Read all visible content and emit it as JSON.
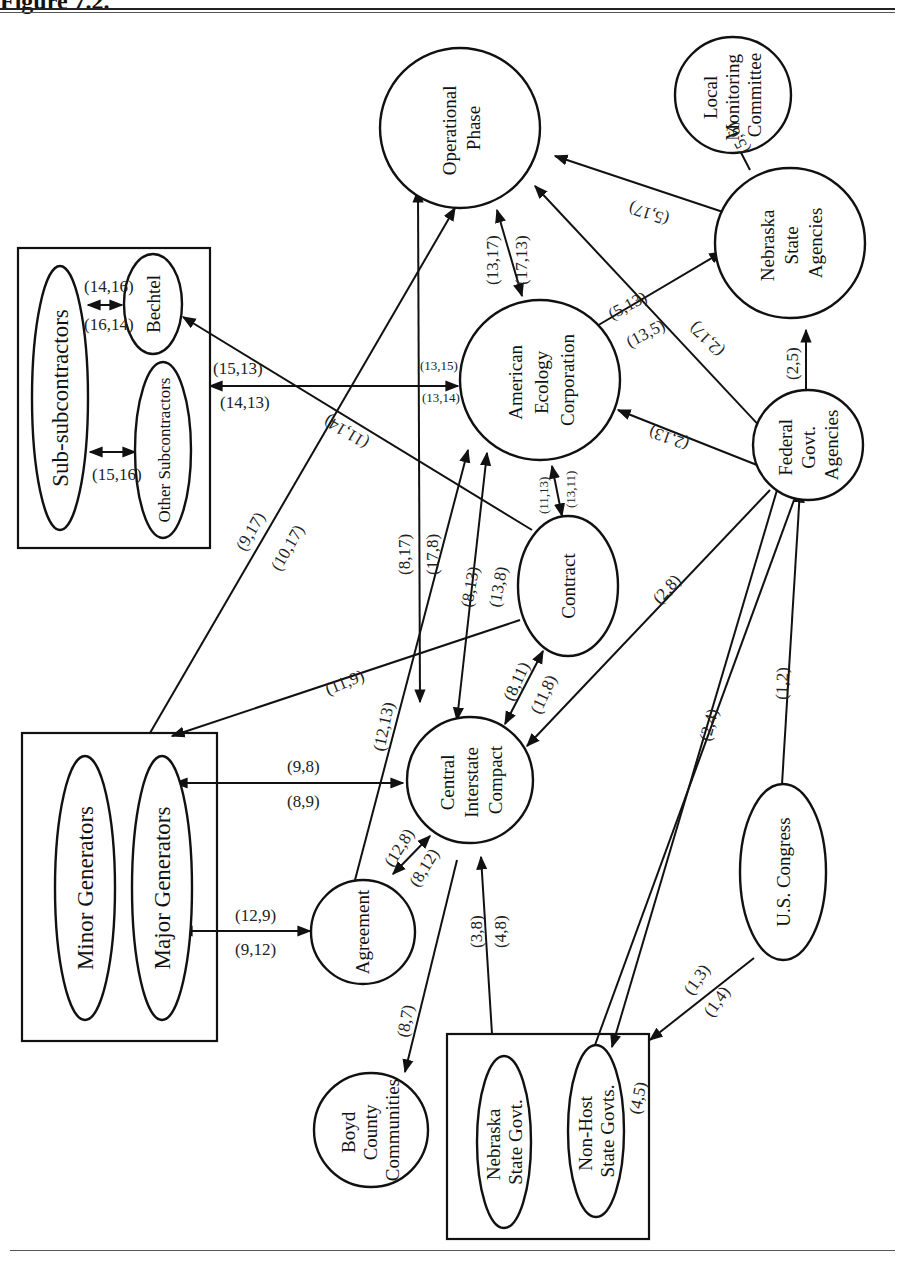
{
  "figure": {
    "title": "Figure 7.2.",
    "orientation": "rotated 90° (text reads bottom-to-top)"
  },
  "groups": {
    "subcontractors_box": [
      "Sub-subcontractors",
      "Bechtel",
      "Other Subcontractors"
    ],
    "generators_box": [
      "Minor Generators",
      "Major Generators"
    ],
    "states_box": [
      "Nebraska State Govt.",
      "Non-Host State Govts."
    ]
  },
  "nodes": {
    "operational_phase": [
      "Operational",
      "Phase"
    ],
    "local_monitoring": [
      "Local",
      "Monitoring",
      "Committee"
    ],
    "nebraska_agencies": [
      "Nebraska",
      "State",
      "Agencies"
    ],
    "american_ecology": [
      "American",
      "Ecology",
      "Corporation"
    ],
    "federal_agencies": [
      "Federal",
      "Govt.",
      "Agencies"
    ],
    "contract": "Contract",
    "central_compact": [
      "Central",
      "Interstate",
      "Compact"
    ],
    "agreement": "Agreement",
    "us_congress": "U.S. Congress",
    "boyd_county": [
      "Boyd",
      "County",
      "Communities"
    ],
    "sub_subcontractors": "Sub-subcontractors",
    "bechtel": "Bechtel",
    "other_subcontractors": "Other Subcontractors",
    "minor_generators": "Minor Generators",
    "major_generators": "Major Generators",
    "nebraska_state_govt": [
      "Nebraska",
      "State Govt."
    ],
    "non_host_states": [
      "Non-Host",
      "State Govts."
    ]
  },
  "edges": [
    {
      "from": "Sub-subcontractors",
      "to": "Bechtel",
      "labels": [
        "(14,16)",
        "(16,14)"
      ]
    },
    {
      "from": "Sub-subcontractors",
      "to": "Other Subcontractors",
      "labels": [
        "(15,16)"
      ]
    },
    {
      "from": "American Ecology Corporation",
      "to": "Subcontractors box",
      "labels": [
        "(15,13)",
        "(14,13)",
        "(13,15)",
        "(13,14)"
      ]
    },
    {
      "from": "Contract",
      "to": "Bechtel",
      "labels": [
        "(11,14)"
      ]
    },
    {
      "from": "Generators box",
      "to": "Operational Phase",
      "labels": [
        "(9,17)",
        "(10,17)"
      ]
    },
    {
      "from": "Central Interstate Compact",
      "to": "Operational Phase",
      "labels": [
        "(8,17)",
        "(17,8)"
      ]
    },
    {
      "from": "American Ecology Corporation",
      "to": "Operational Phase",
      "labels": [
        "(13,17)",
        "(17,13)"
      ]
    },
    {
      "from": "Nebraska State Agencies",
      "to": "Operational Phase",
      "labels": [
        "(5,17)"
      ]
    },
    {
      "from": "Federal Govt. Agencies",
      "to": "Operational Phase",
      "labels": [
        "(2,17)"
      ]
    },
    {
      "from": "Nebraska State Agencies",
      "to": "Local Monitoring Committee",
      "labels": [
        "(5,6)"
      ]
    },
    {
      "from": "American Ecology Corporation",
      "to": "Nebraska State Agencies",
      "labels": [
        "(5,13)",
        "(13,5)"
      ]
    },
    {
      "from": "Federal Govt. Agencies",
      "to": "Nebraska State Agencies",
      "labels": [
        "(2,5)"
      ]
    },
    {
      "from": "Federal Govt. Agencies",
      "to": "American Ecology Corporation",
      "labels": [
        "(2,13)"
      ]
    },
    {
      "from": "American Ecology Corporation",
      "to": "Contract",
      "labels": [
        "(11,13)",
        "(13,11)"
      ]
    },
    {
      "from": "Central Interstate Compact",
      "to": "American Ecology Corporation",
      "labels": [
        "(8,13)",
        "(13,8)"
      ]
    },
    {
      "from": "Agreement",
      "to": "American Ecology Corporation",
      "labels": [
        "(12,13)"
      ]
    },
    {
      "from": "Contract",
      "to": "Major Generators",
      "labels": [
        "(11,9)"
      ]
    },
    {
      "from": "Federal Govt. Agencies",
      "to": "Central Interstate Compact",
      "labels": [
        "(2,8)"
      ]
    },
    {
      "from": "Central Interstate Compact",
      "to": "Contract",
      "labels": [
        "(8,11)",
        "(11,8)"
      ]
    },
    {
      "from": "Major Generators",
      "to": "Central Interstate Compact",
      "labels": [
        "(9,8)",
        "(8,9)"
      ]
    },
    {
      "from": "Agreement",
      "to": "Central Interstate Compact",
      "labels": [
        "(12,8)",
        "(8,12)"
      ]
    },
    {
      "from": "Major Generators",
      "to": "Agreement",
      "labels": [
        "(12,9)",
        "(9,12)"
      ]
    },
    {
      "from": "Central Interstate Compact",
      "to": "Boyd County Communities",
      "labels": [
        "(8,7)"
      ]
    },
    {
      "from": "States box",
      "to": "Central Interstate Compact",
      "labels": [
        "(3,8)",
        "(4,8)"
      ]
    },
    {
      "from": "Non-Host State Govts.",
      "to": "Nebraska State Agencies",
      "labels": [
        "(4,5)"
      ]
    },
    {
      "from": "Federal Govt. Agencies",
      "to": "Non-Host State Govts.",
      "labels": [
        "(2,4)"
      ]
    },
    {
      "from": "U.S. Congress",
      "to": "Federal Govt. Agencies",
      "labels": [
        "(1,2)"
      ]
    },
    {
      "from": "U.S. Congress",
      "to": "States box",
      "labels": [
        "(1,3)",
        "(1,4)"
      ]
    }
  ],
  "edge_labels": {
    "l14_16": "(14,16)",
    "l16_14": "(16,14)",
    "l15_16": "(15,16)",
    "l15_13": "(15,13)",
    "l14_13": "(14,13)",
    "l13_15": "(13,15)",
    "l13_14": "(13,14)",
    "l11_14": "(11,14)",
    "l9_17": "(9,17)",
    "l10_17": "(10,17)",
    "l8_17": "(8,17)",
    "l17_8": "(17,8)",
    "l13_17": "(13,17)",
    "l17_13": "(17,13)",
    "l5_17": "(5,17)",
    "l2_17": "(2,17)",
    "l5_6": "(5,6)",
    "l5_13": "(5,13)",
    "l13_5": "(13,5)",
    "l2_5": "(2,5)",
    "l2_13": "(2,13)",
    "l11_13": "(11,13)",
    "l13_11": "(13,11)",
    "l8_13": "(8,13)",
    "l13_8": "(13,8)",
    "l12_13": "(12,13)",
    "l11_9": "(11,9)",
    "l2_8": "(2,8)",
    "l8_11": "(8,11)",
    "l11_8": "(11,8)",
    "l9_8": "(9,8)",
    "l8_9": "(8,9)",
    "l12_8": "(12,8)",
    "l8_12": "(8,12)",
    "l12_9": "(12,9)",
    "l9_12": "(9,12)",
    "l8_7": "(8,7)",
    "l3_8": "(3,8)",
    "l4_8": "(4,8)",
    "l4_5": "(4,5)",
    "l2_4": "(2,4)",
    "l1_2": "(1,2)",
    "l1_3": "(1,3)",
    "l1_4": "(1,4)"
  }
}
